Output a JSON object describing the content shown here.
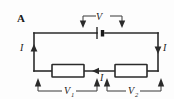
{
  "figure": {
    "panel_letter": "A",
    "type": "series-circuit-diagram",
    "background_color": "#fdfdfd",
    "line_color": "#2b2b2b"
  },
  "labels": {
    "source_voltage": "V",
    "current_left": "I",
    "current_right": "I",
    "current_bottom": "I",
    "resistor1_voltage_base": "V",
    "resistor1_voltage_sub": "1",
    "resistor2_voltage_base": "V",
    "resistor2_voltage_sub": "2"
  },
  "components": {
    "battery": "battery-cell-symbol",
    "resistor_left": "resistor-rectangle",
    "resistor_right": "resistor-rectangle"
  },
  "measurement_brackets": [
    {
      "name": "V",
      "position": "top",
      "spans": "battery"
    },
    {
      "name": "V1",
      "position": "bottom-left",
      "spans": "left-resistor"
    },
    {
      "name": "V2",
      "position": "bottom-right",
      "spans": "right-resistor"
    }
  ]
}
